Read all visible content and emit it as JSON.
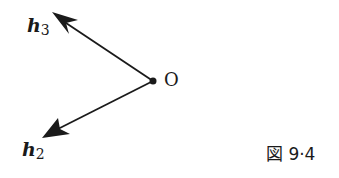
{
  "figure": {
    "caption": "図 9·4",
    "origin_label": "O",
    "vectors": [
      {
        "name": "h",
        "subscript": "3",
        "direction": "upper-left"
      },
      {
        "name": "h",
        "subscript": "2",
        "direction": "lower-left"
      }
    ],
    "colors": {
      "ink": "#1a1a1a",
      "background": "#ffffff"
    }
  }
}
